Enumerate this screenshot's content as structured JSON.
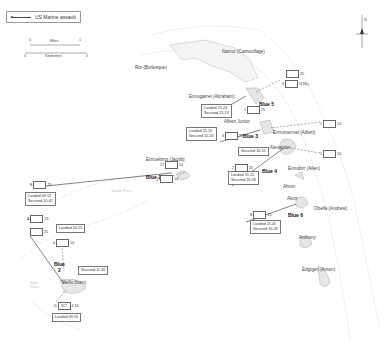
{
  "legend": {
    "label": "US Marine assault"
  },
  "scale": {
    "miles_label": "Miles",
    "km_label": "Kilometers",
    "miles_start": "0",
    "miles_end": "1",
    "km_start": "0",
    "km_end": "2"
  },
  "north": {
    "label": "N"
  },
  "islands": {
    "roi": "Roi (Burlesque)",
    "namur": "Namur (Camouflage)",
    "ennugarret": "Ennugarret (Abraham)",
    "albert_junior": "Albert Junior",
    "ennumennet": "Ennumennet (Albert)",
    "alexander": "Alexander",
    "ennubirr": "Ennubirr (Allen)",
    "ennuebing": "Ennuebing (Jacob)",
    "ahron": "Ahron",
    "alvin": "Alvin",
    "obella": "Obella (Andrew)",
    "anthony": "Anthony",
    "edgigen": "Edgigen (Anton)",
    "mellu": "Mellu (Ivan)"
  },
  "waters": {
    "jacob_pass": "Jacob Pass",
    "ivan_pass": "Ivan\nPass"
  },
  "beaches": {
    "blue1": "Blue 1",
    "blue2": "Blue\n2",
    "blue3": "Blue 3",
    "blue4": "Blue 4",
    "blue5": "Blue 5",
    "blue6": "Blue 6"
  },
  "timelines": {
    "blue5": "Landed 15.24\nSecured 15.13",
    "blue3": "Landed 15.15\nSecured 15.20",
    "alexander": "Secured 16.15",
    "blue4": "Landed 15.15\nSecured 16.28",
    "blue6": "Landed 15.45\nSecured 16.26",
    "blue1": "Landed 09.52\nSecured 10.42",
    "blue2_landed": "Landed 10.15",
    "mellu_secured": "Secured 11.45",
    "mellu_landed": "Landed 09.55"
  },
  "units": {
    "namur_a": {
      "left": "",
      "right": "25"
    },
    "namur_b": {
      "left": "3",
      "right": "1(18)+"
    },
    "blue5": {
      "left": "1",
      "right": "25"
    },
    "ennumennet": {
      "left": "1",
      "right": "14"
    },
    "blue3": {
      "left": "3",
      "right": "25"
    },
    "ennubirr": {
      "left": "1",
      "right": "14"
    },
    "blue4": {
      "left": "2",
      "right": "25"
    },
    "blue6": {
      "left": "B",
      "right": "25"
    },
    "ennuebing_a": {
      "left": "17",
      "right": "14"
    },
    "ennuebing_b": {
      "left": "2",
      "right": "14"
    },
    "blue1": {
      "left": "B",
      "right": "25"
    },
    "blue2_a": {
      "left": "A",
      "right": "25"
    },
    "blue2_b": {
      "left": "",
      "right": "25"
    },
    "mellu_arty": {
      "left": "4",
      "right": "14"
    },
    "mellu_sc": {
      "left": "D",
      "right": "4 16",
      "center": "SCT"
    }
  }
}
